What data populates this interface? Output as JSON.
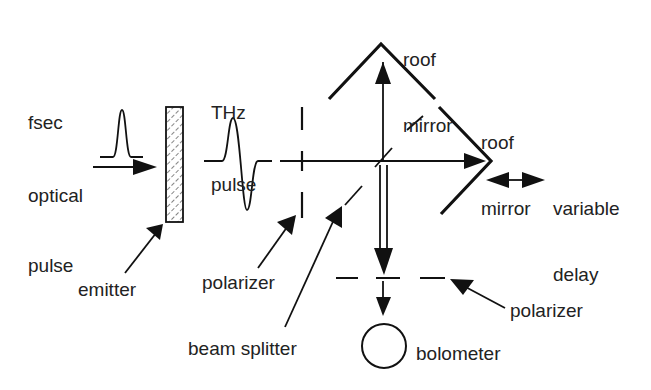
{
  "labels": {
    "fsec_optical_pulse": [
      "fsec",
      "optical",
      "pulse"
    ],
    "thz_pulse": [
      "THz",
      "pulse"
    ],
    "roof_mirror_top": [
      "roof",
      "mirror"
    ],
    "roof_mirror_right": [
      "roof",
      "mirror"
    ],
    "variable_delay": [
      "variable",
      "delay"
    ],
    "emitter": "emitter",
    "polarizer_left": "polarizer",
    "polarizer_right": "polarizer",
    "beam_splitter": "beam splitter",
    "bolometer": "bolometer"
  },
  "colors": {
    "line": "#111111",
    "text": "#222222",
    "background": "#ffffff"
  }
}
